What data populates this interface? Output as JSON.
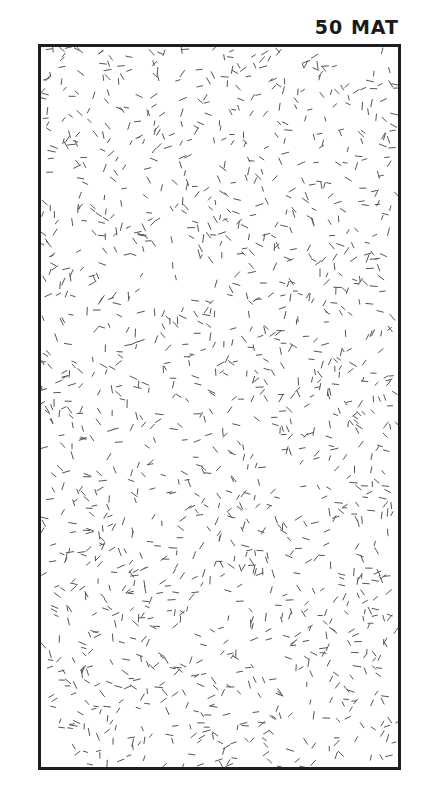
{
  "swatch": {
    "label": "50 MAT",
    "border_color": "#1e1e1e",
    "background_color": "#ffffff",
    "pattern": {
      "type": "random-dashes",
      "stroke_color": "#555555",
      "dash_length": 6,
      "density": 1500
    }
  }
}
